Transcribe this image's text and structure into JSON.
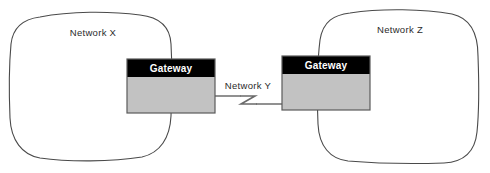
{
  "diagram": {
    "type": "network-topology",
    "width": 490,
    "height": 173,
    "background_color": "#ffffff",
    "clouds": [
      {
        "id": "network-x",
        "label": "Network X",
        "label_x": 93,
        "label_y": 36,
        "bounds": {
          "x": 10,
          "y": 12,
          "width": 162,
          "height": 148
        },
        "stroke_color": "#4a4a4a",
        "fill_color": "#ffffff"
      },
      {
        "id": "network-z",
        "label": "Network Z",
        "label_x": 400,
        "label_y": 33,
        "bounds": {
          "x": 318,
          "y": 9,
          "width": 160,
          "height": 154
        },
        "stroke_color": "#4a4a4a",
        "fill_color": "#ffffff"
      }
    ],
    "gateways": [
      {
        "id": "gateway-left",
        "label": "Gateway",
        "x": 127,
        "y": 59,
        "width": 88,
        "height": 54,
        "header_height": 18,
        "header_color": "#000000",
        "header_text_color": "#ffffff",
        "body_color": "#c2c2c2",
        "border_color": "#5a5a5a"
      },
      {
        "id": "gateway-right",
        "label": "Gateway",
        "x": 282,
        "y": 56,
        "width": 88,
        "height": 54,
        "header_height": 18,
        "header_color": "#000000",
        "header_text_color": "#ffffff",
        "body_color": "#c2c2c2",
        "border_color": "#5a5a5a"
      }
    ],
    "link": {
      "id": "network-y-link",
      "label": "Network Y",
      "label_x": 222,
      "label_y": 88,
      "from": "gateway-left",
      "to": "gateway-right",
      "line_color": "#555555",
      "symbol": "lightning-zigzag",
      "left_x": 215,
      "right_x": 282,
      "left_y": 96,
      "right_y": 99
    }
  }
}
